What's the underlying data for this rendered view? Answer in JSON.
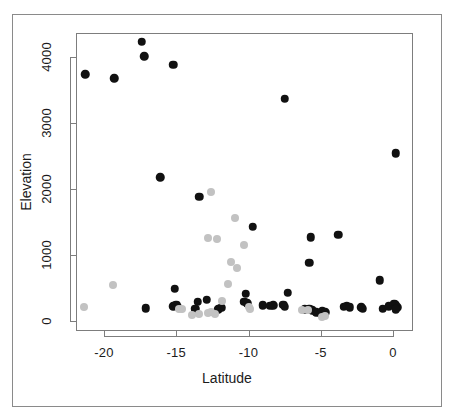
{
  "chart_data": {
    "type": "scatter",
    "title": "",
    "xlabel": "Latitude",
    "ylabel": "Elevation",
    "xlim": [
      -21.8,
      0.7
    ],
    "ylim": [
      -130,
      4620
    ],
    "grid": false,
    "legend": "none",
    "xticks": [
      -20,
      -15,
      -10,
      -5,
      0
    ],
    "xticklabels": [
      "-20",
      "-15",
      "-10",
      "-5",
      "0"
    ],
    "yticks": [
      0,
      1000,
      2000,
      3000,
      4000
    ],
    "yticklabels": [
      "0",
      "1000",
      "2000",
      "3000",
      "4000"
    ],
    "marker": "filled-circle",
    "series": [
      {
        "name": "black-points",
        "color": "#111111",
        "points": [
          [
            -21.3,
            3740
          ],
          [
            -19.3,
            3680
          ],
          [
            -17.4,
            4530
          ],
          [
            -17.4,
            4230
          ],
          [
            -17.2,
            4010
          ],
          [
            -15.2,
            3880
          ],
          [
            -16.1,
            2180
          ],
          [
            -13.4,
            1880
          ],
          [
            -7.5,
            3370
          ],
          [
            0.2,
            2540
          ],
          [
            -9.7,
            1430
          ],
          [
            -5.7,
            1270
          ],
          [
            -3.8,
            1310
          ],
          [
            -5.8,
            880
          ],
          [
            -0.9,
            620
          ],
          [
            -15.1,
            490
          ],
          [
            -10.2,
            410
          ],
          [
            -7.3,
            430
          ],
          [
            -12.9,
            320
          ],
          [
            -13.5,
            290
          ],
          [
            -10.3,
            290
          ],
          [
            -10.1,
            270
          ],
          [
            -9.0,
            240
          ],
          [
            -8.5,
            230
          ],
          [
            -8.3,
            240
          ],
          [
            -7.6,
            250
          ],
          [
            -7.5,
            215
          ],
          [
            -17.1,
            195
          ],
          [
            -15.2,
            225
          ],
          [
            -15.0,
            245
          ],
          [
            -14.9,
            215
          ],
          [
            -13.7,
            185
          ],
          [
            -12.1,
            175
          ],
          [
            -11.9,
            200
          ],
          [
            -6.1,
            180
          ],
          [
            -5.8,
            185
          ],
          [
            -5.6,
            160
          ],
          [
            -5.3,
            130
          ],
          [
            -5.0,
            115
          ],
          [
            -4.9,
            150
          ],
          [
            -4.7,
            130
          ],
          [
            -3.4,
            215
          ],
          [
            -3.2,
            230
          ],
          [
            -3.0,
            205
          ],
          [
            -2.2,
            210
          ],
          [
            -2.1,
            185
          ],
          [
            -0.7,
            185
          ],
          [
            -0.3,
            225
          ],
          [
            0.1,
            265
          ],
          [
            0.2,
            235
          ],
          [
            0.3,
            205
          ],
          [
            0.2,
            175
          ]
        ]
      },
      {
        "name": "gray-points",
        "color": "#c2c2c2",
        "points": [
          [
            -21.4,
            215
          ],
          [
            -19.4,
            545
          ],
          [
            -12.6,
            1950
          ],
          [
            -10.9,
            1560
          ],
          [
            -12.8,
            1260
          ],
          [
            -12.2,
            1240
          ],
          [
            -10.3,
            1150
          ],
          [
            -11.2,
            900
          ],
          [
            -10.8,
            800
          ],
          [
            -11.4,
            560
          ],
          [
            -11.8,
            300
          ],
          [
            -14.8,
            185
          ],
          [
            -14.6,
            175
          ],
          [
            -13.9,
            95
          ],
          [
            -13.4,
            110
          ],
          [
            -12.8,
            120
          ],
          [
            -12.6,
            130
          ],
          [
            -12.3,
            110
          ],
          [
            -10.0,
            205
          ],
          [
            -9.9,
            180
          ],
          [
            -6.3,
            165
          ],
          [
            -5.9,
            165
          ],
          [
            -4.9,
            60
          ],
          [
            -4.7,
            70
          ]
        ]
      }
    ]
  },
  "axis": {
    "x_title": "Latitude",
    "y_title": "Elevation"
  }
}
